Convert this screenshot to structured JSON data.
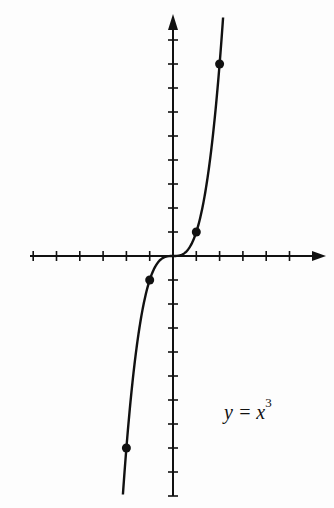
{
  "chart_data": {
    "type": "line",
    "title": "",
    "equation_label": "y = x",
    "equation_exponent": "3",
    "xlabel": "",
    "ylabel": "",
    "xlim": [
      -6,
      6
    ],
    "ylim": [
      -10,
      9
    ],
    "grid": false,
    "series": [
      {
        "name": "y = x^3",
        "x": [
          -2.1,
          -2,
          -1,
          0,
          1,
          2,
          2.1
        ],
        "y": [
          -9.26,
          -8,
          -1,
          0,
          1,
          8,
          9.26
        ]
      }
    ],
    "marked_points": [
      {
        "x": -2,
        "y": -8
      },
      {
        "x": -1,
        "y": -1
      },
      {
        "x": 1,
        "y": 1
      },
      {
        "x": 2,
        "y": 8
      }
    ],
    "x_ticks": [
      -6,
      -5,
      -4,
      -3,
      -2,
      -1,
      1,
      2,
      3,
      4,
      5
    ],
    "y_ticks": [
      -10,
      -9,
      -8,
      -7,
      -6,
      -5,
      -4,
      -3,
      -2,
      -1,
      1,
      2,
      3,
      4,
      5,
      6,
      7,
      8,
      9
    ]
  },
  "label": {
    "main": "y = x",
    "exp": "3"
  }
}
